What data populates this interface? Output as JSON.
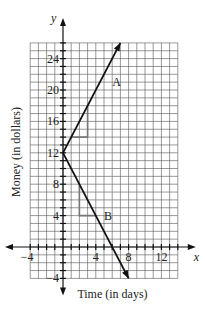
{
  "chart_data": {
    "type": "line",
    "title": "",
    "xlabel": "Time (in days)",
    "ylabel": "Money (in dollars)",
    "x_axis_name": "x",
    "y_axis_name": "y",
    "xlim": [
      -4,
      14
    ],
    "ylim": [
      -4,
      26
    ],
    "grid": true,
    "grid_step": 1,
    "x_ticks": [
      -4,
      4,
      8,
      12
    ],
    "y_ticks": [
      -4,
      4,
      8,
      12,
      16,
      20,
      24
    ],
    "series": [
      {
        "name": "A",
        "points": [
          [
            0,
            12
          ],
          [
            7,
            26
          ]
        ],
        "slope": 2,
        "intercept": 12,
        "arrow": true,
        "label_pos": [
          6,
          21
        ]
      },
      {
        "name": "B",
        "points": [
          [
            0,
            12
          ],
          [
            8,
            -4
          ]
        ],
        "slope": -2,
        "intercept": 12,
        "arrow": true,
        "label_pos": [
          5,
          4
        ]
      }
    ],
    "annotations": [
      {
        "type": "slope-triangle",
        "series": "A",
        "points": [
          [
            1,
            14
          ],
          [
            3,
            14
          ],
          [
            3,
            18
          ]
        ]
      },
      {
        "type": "slope-triangle",
        "series": "B",
        "points": [
          [
            2,
            8
          ],
          [
            2,
            4
          ],
          [
            4,
            4
          ]
        ]
      }
    ]
  }
}
